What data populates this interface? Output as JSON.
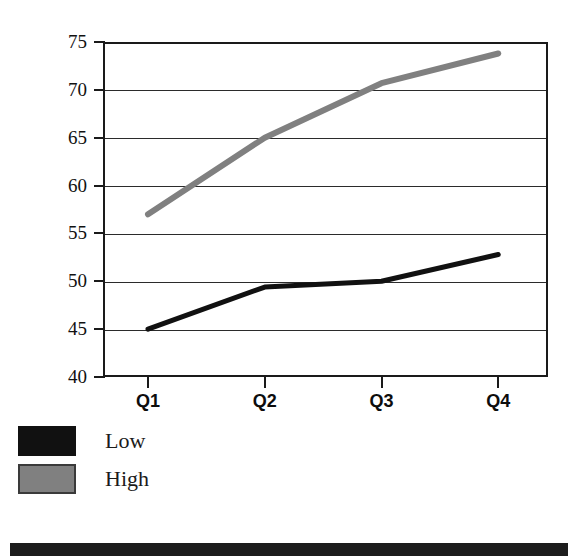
{
  "chart_data": {
    "type": "line",
    "title": "",
    "subtitle": "",
    "xlabel": "",
    "ylabel": "",
    "categories": [
      "Q1",
      "Q2",
      "Q3",
      "Q4"
    ],
    "series": [
      {
        "name": "Low",
        "values": [
          45.0,
          49.4,
          50.0,
          52.8
        ],
        "color": "#111111",
        "line_width": 5
      },
      {
        "name": "High",
        "values": [
          57.0,
          65.0,
          70.7,
          73.8
        ],
        "color": "#808080",
        "line_width": 6
      }
    ],
    "ylim": [
      40,
      75
    ],
    "xlim": [
      0,
      5
    ],
    "y_ticks": [
      40,
      45,
      50,
      55,
      60,
      65,
      70,
      75
    ],
    "y_tick_labels": [
      "40",
      "45",
      "50",
      "55",
      "60",
      "65",
      "70",
      "75"
    ],
    "x_tick_labels": [
      "Q1",
      "Q2",
      "Q3",
      "Q4"
    ],
    "grid": true,
    "grid_axis": "y",
    "legend_position": "below-left",
    "frame": true,
    "markers": false
  },
  "axes": {
    "y_labels": [
      "75",
      "70",
      "65",
      "60",
      "55",
      "50",
      "45",
      "40"
    ],
    "x_labels": [
      "Q1",
      "Q2",
      "Q3",
      "Q4"
    ]
  },
  "legend": {
    "entries": [
      {
        "label": "Low",
        "color": "#111111"
      },
      {
        "label": "High",
        "color": "#808080"
      }
    ]
  },
  "colors": {
    "series_low": "#111111",
    "series_high": "#808080",
    "axis": "#1a1a1a",
    "grid": "#2b2b2b",
    "background": "#ffffff",
    "scan_bar": "#1d1d1d"
  }
}
